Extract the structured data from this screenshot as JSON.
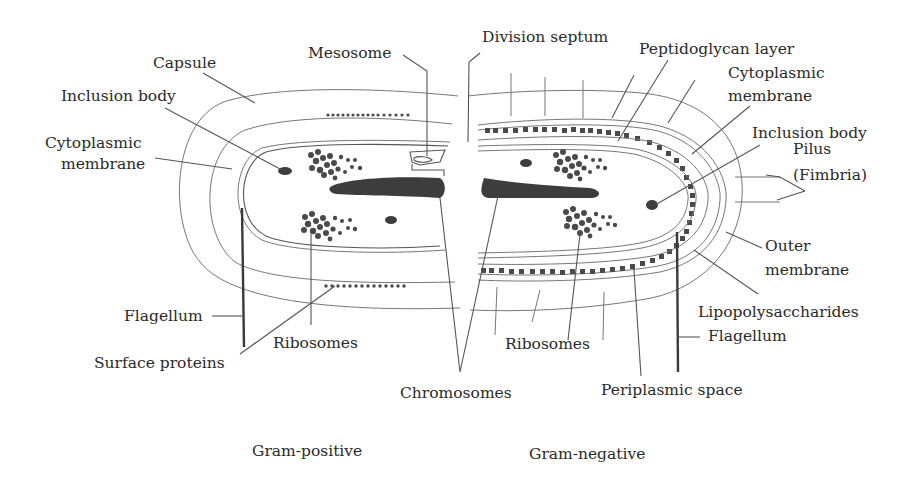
{
  "diagram": {
    "panels": [
      {
        "id": "gram-positive",
        "caption": "Gram-positive"
      },
      {
        "id": "gram-negative",
        "caption": "Gram-negative"
      }
    ],
    "labels": {
      "capsule": "Capsule",
      "mesosome": "Mesosome",
      "division_septum": "Division septum",
      "inclusion_body_left": "Inclusion body",
      "cytoplasmic_membrane_left_1": "Cytoplasmic",
      "cytoplasmic_membrane_left_2": "membrane",
      "flagellum_left": "Flagellum",
      "surface_proteins": "Surface proteins",
      "ribosomes_left": "Ribosomes",
      "chromosomes": "Chromosomes",
      "peptidoglycan_layer": "Peptidoglycan layer",
      "cytoplasmic_membrane_right_1": "Cytoplasmic",
      "cytoplasmic_membrane_right_2": "membrane",
      "inclusion_body_right": "Inclusion body",
      "pilus_1": "Pilus",
      "pilus_2": "(Fimbria)",
      "outer_membrane_1": "Outer",
      "outer_membrane_2": "membrane",
      "lipopolysaccharides": "Lipopolysaccharides",
      "flagellum_right": "Flagellum",
      "ribosomes_right": "Ribosomes",
      "periplasmic_space": "Periplasmic space",
      "caption_left": "Gram-positive",
      "caption_right": "Gram-negative"
    },
    "colors": {
      "background": "#ffffff",
      "ink": "#2a2a2a",
      "fill": "#3d3d3d"
    }
  }
}
